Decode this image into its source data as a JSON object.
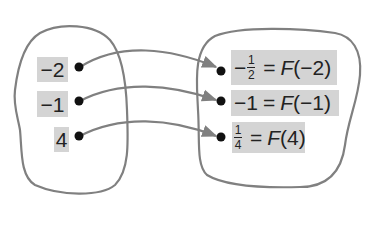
{
  "diagram": {
    "type": "function-mapping",
    "function_name": "F",
    "colors": {
      "outline": "#777777",
      "label_bg": "#d4d4d4",
      "dot": "#111111",
      "text": "#222222"
    },
    "domain": {
      "items": [
        {
          "label": "−2"
        },
        {
          "label": "−1"
        },
        {
          "label": "4"
        }
      ]
    },
    "range": {
      "items": [
        {
          "value_sign": "−",
          "value_num": "1",
          "value_den": "2",
          "equals": "=",
          "fn": "F",
          "arg": "(−2)"
        },
        {
          "value": "−1",
          "equals": "=",
          "fn": "F",
          "arg": "(−1)"
        },
        {
          "value_sign": "",
          "value_num": "1",
          "value_den": "4",
          "equals": "=",
          "fn": "F",
          "arg": "(4)"
        }
      ]
    },
    "mappings": [
      {
        "from": "−2",
        "to": "−1/2"
      },
      {
        "from": "−1",
        "to": "−1"
      },
      {
        "from": "4",
        "to": "1/4"
      }
    ]
  }
}
